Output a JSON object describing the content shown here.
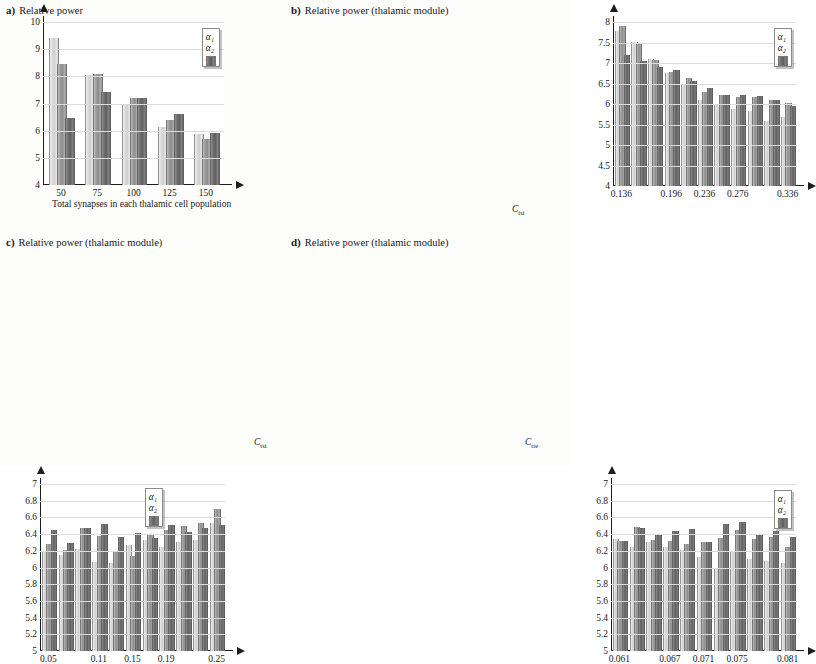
{
  "figure": {
    "legend_labels": [
      "α₁",
      "α₂",
      "α₃"
    ],
    "series_colors": [
      "#d9d9d9",
      "#9a9a9a",
      "#6d6d6d"
    ],
    "caption": ""
  },
  "chart_data": [
    {
      "id": "a",
      "type": "bar",
      "panel_letter": "a)",
      "title": "Relative power",
      "xlabel": "Total synapses in each thalamic cell population",
      "ylabel": "",
      "ylim": [
        4,
        10
      ],
      "yticks": [
        "10",
        "9",
        "8",
        "7",
        "6",
        "5",
        "4"
      ],
      "ytick_values": [
        10,
        9,
        8,
        7,
        6,
        5,
        4
      ],
      "categories": [
        "50",
        "75",
        "100",
        "125",
        "150"
      ],
      "xtick_labels": [
        "50",
        "75",
        "100",
        "125",
        "150"
      ],
      "grid": true,
      "legend_position": "top-right",
      "series": [
        {
          "name": "α₁",
          "values": [
            9.4,
            8.05,
            6.95,
            6.13,
            5.87
          ]
        },
        {
          "name": "α₂",
          "values": [
            8.47,
            8.1,
            7.21,
            6.4,
            5.68
          ]
        },
        {
          "name": "α₃",
          "values": [
            6.45,
            7.42,
            7.21,
            6.6,
            5.93
          ]
        }
      ]
    },
    {
      "id": "b",
      "type": "bar",
      "panel_letter": "b)",
      "title": "Relative power (thalamic module)",
      "xlabel": "C",
      "xlabel_sub": "isi",
      "ylim": [
        4,
        8
      ],
      "yticks": [
        "8",
        "7.5",
        "7",
        "6.5",
        "6",
        "5.5",
        "5",
        "4.5",
        "4"
      ],
      "ytick_values": [
        8,
        7.5,
        7,
        6.5,
        6,
        5.5,
        5,
        4.5,
        4
      ],
      "categories": [
        "0.136",
        "0.156",
        "0.176",
        "0.196",
        "0.216",
        "0.236",
        "0.256",
        "0.276",
        "0.296",
        "0.316",
        "0.336"
      ],
      "xtick_labels": [
        "0.136",
        "0.196",
        "0.236",
        "0.276",
        "0.336"
      ],
      "xtick_positions": [
        0,
        3,
        5,
        7,
        10
      ],
      "grid": true,
      "legend_position": "top-right",
      "series": [
        {
          "name": "α₁",
          "values": [
            7.79,
            7.52,
            7.11,
            6.76,
            6.47,
            6.1,
            5.98,
            5.89,
            5.82,
            5.58,
            5.69
          ]
        },
        {
          "name": "α₂",
          "values": [
            7.9,
            7.49,
            7.08,
            6.77,
            6.64,
            6.3,
            6.22,
            6.18,
            6.16,
            6.1,
            6.02
          ]
        },
        {
          "name": "α₃",
          "values": [
            7.2,
            7.05,
            6.9,
            6.82,
            6.56,
            6.38,
            6.23,
            6.22,
            6.2,
            6.09,
            5.95
          ]
        }
      ]
    },
    {
      "id": "c",
      "type": "bar",
      "panel_letter": "c)",
      "title": "Relative power (thalamic module)",
      "xlabel": "C",
      "xlabel_sub": "tsi",
      "ylim": [
        5,
        7
      ],
      "yticks": [
        "7",
        "6.8",
        "6.6",
        "6.4",
        "6.2",
        "6",
        "5.8",
        "5.6",
        "5.4",
        "5.2",
        "5"
      ],
      "ytick_values": [
        7,
        6.8,
        6.6,
        6.4,
        6.2,
        6,
        5.8,
        5.6,
        5.4,
        5.2,
        5
      ],
      "categories": [
        "0.05",
        "0.07",
        "0.09",
        "0.11",
        "0.13",
        "0.15",
        "0.17",
        "0.19",
        "0.21",
        "0.23",
        "0.25"
      ],
      "xtick_labels": [
        "0.05",
        "0.11",
        "0.15",
        "0.19",
        "0.25"
      ],
      "xtick_positions": [
        0,
        3,
        5,
        7,
        10
      ],
      "grid": true,
      "legend_position": "top-center",
      "series": [
        {
          "name": "α₁",
          "values": [
            6.19,
            6.15,
            6.22,
            6.07,
            6.06,
            6.27,
            6.33,
            6.25,
            6.31,
            6.33,
            6.53
          ]
        },
        {
          "name": "α₂",
          "values": [
            6.28,
            6.21,
            6.47,
            6.38,
            6.2,
            6.14,
            6.4,
            6.45,
            6.5,
            6.53,
            6.7
          ]
        },
        {
          "name": "α₃",
          "values": [
            6.45,
            6.29,
            6.47,
            6.52,
            6.37,
            6.41,
            6.35,
            6.51,
            6.42,
            6.47,
            6.51
          ]
        }
      ]
    },
    {
      "id": "d",
      "type": "bar",
      "panel_letter": "d)",
      "title": "Relative power (thalamic module)",
      "xlabel": "C",
      "xlabel_sub": "tre",
      "ylim": [
        5,
        7
      ],
      "yticks": [
        "7",
        "6.8",
        "6.6",
        "6.4",
        "6.2",
        "6",
        "5.8",
        "5.6",
        "5.4",
        "5.2",
        "5"
      ],
      "ytick_values": [
        7,
        6.8,
        6.6,
        6.4,
        6.2,
        6,
        5.8,
        5.6,
        5.4,
        5.2,
        5
      ],
      "categories": [
        "0.061",
        "0.063",
        "0.065",
        "0.067",
        "0.069",
        "0.071",
        "0.073",
        "0.075",
        "0.077",
        "0.079",
        "0.081"
      ],
      "xtick_labels": [
        "0.061",
        "0.067",
        "0.071",
        "0.075",
        "0.081"
      ],
      "xtick_positions": [
        0,
        3,
        5,
        7,
        10
      ],
      "grid": true,
      "legend_position": "top-right",
      "series": [
        {
          "name": "α₁",
          "values": [
            6.34,
            6.24,
            6.3,
            6.25,
            6.21,
            6.13,
            6.0,
            6.18,
            6.1,
            6.08,
            6.06
          ]
        },
        {
          "name": "α₂",
          "values": [
            6.32,
            6.48,
            6.33,
            6.32,
            6.28,
            6.31,
            6.35,
            6.45,
            6.34,
            6.36,
            6.25
          ]
        },
        {
          "name": "α₃",
          "values": [
            6.32,
            6.47,
            6.4,
            6.44,
            6.46,
            6.3,
            6.52,
            6.54,
            6.4,
            6.44,
            6.36
          ]
        }
      ]
    }
  ]
}
